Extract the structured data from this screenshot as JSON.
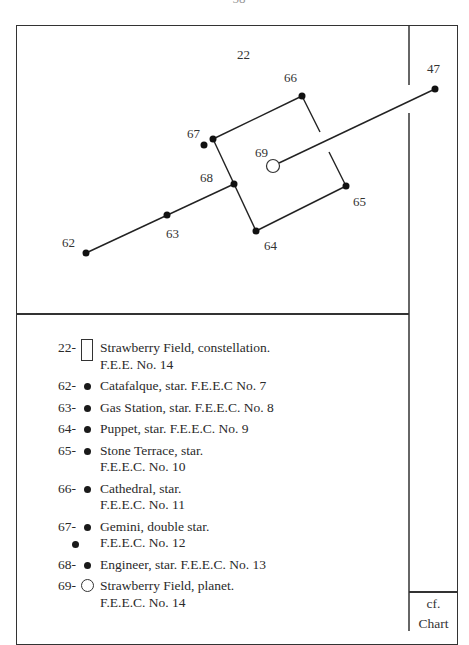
{
  "page_number_fragment": "- 58 -",
  "chart": {
    "labels": {
      "22": "22",
      "47": "47",
      "62": "62",
      "63": "63",
      "64": "64",
      "65": "65",
      "66": "66",
      "67": "67",
      "68": "68",
      "69": "69"
    }
  },
  "legend": [
    {
      "num": "22-",
      "symbol": "rectangle",
      "line1": "Strawberry Field, constellation.",
      "line2": "F.E.E. No. 14"
    },
    {
      "num": "62-",
      "symbol": "dot",
      "line1": "Catafalque, star. F.E.E.C No. 7"
    },
    {
      "num": "63-",
      "symbol": "dot",
      "line1": "Gas Station, star. F.E.E.C. No. 8"
    },
    {
      "num": "64-",
      "symbol": "dot",
      "line1": "Puppet, star. F.E.E.C. No. 9"
    },
    {
      "num": "65-",
      "symbol": "dot",
      "line1": "Stone Terrace, star.",
      "line2": "F.E.E.C. No. 10"
    },
    {
      "num": "66-",
      "symbol": "dot",
      "line1": "Cathedral, star.",
      "line2": "F.E.E.C. No. 11"
    },
    {
      "num": "67-",
      "symbol": "double-dot",
      "line1": "Gemini, double star.",
      "line2": "F.E.E.C. No. 12"
    },
    {
      "num": "68-",
      "symbol": "dot",
      "line1": "Engineer, star. F.E.E.C. No. 13"
    },
    {
      "num": "69-",
      "symbol": "circle",
      "line1": "Strawberry Field, planet.",
      "line2": "F.E.E.C. No. 14"
    }
  ],
  "side": {
    "cf": "cf.",
    "chart": "Chart"
  }
}
